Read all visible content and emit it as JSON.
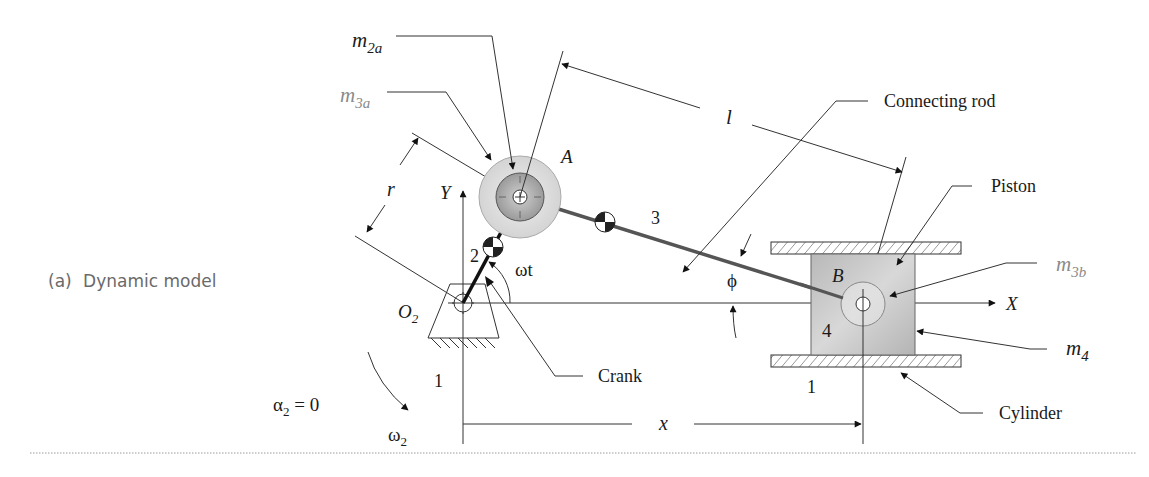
{
  "caption": {
    "prefix": "(a)",
    "text": "Dynamic model"
  },
  "labels": {
    "m2a": {
      "base": "m",
      "sub": "2a"
    },
    "m3a": {
      "base": "m",
      "sub": "3a"
    },
    "m3b": {
      "base": "m",
      "sub": "3b"
    },
    "m4": {
      "base": "m",
      "sub": "4"
    },
    "point_A": "A",
    "point_B": "B",
    "origin": {
      "base": "O",
      "sub": "2"
    },
    "axis_x": "X",
    "axis_y": "Y",
    "crank_length": "r",
    "rod_length": "l",
    "piston_position": "x",
    "crank_angle": "ωt",
    "rod_angle": "ϕ",
    "link_crank": "2",
    "link_rod": "3",
    "link_piston": "4",
    "ground_left": "1",
    "ground_right": "1",
    "alpha": {
      "base": "α",
      "sub": "2",
      "rest": " = 0"
    },
    "omega": {
      "base": "ω",
      "sub": "2"
    }
  },
  "callouts": {
    "connecting_rod": "Connecting rod",
    "piston": "Piston",
    "crank": "Crank",
    "cylinder": "Cylinder"
  },
  "colors": {
    "mass_outer": "#dcdcdc",
    "mass_inner": "#a8a8a8",
    "piston_fill": "#c8c8c8",
    "line": "#333333",
    "label_gray": "#8a8a8a"
  }
}
